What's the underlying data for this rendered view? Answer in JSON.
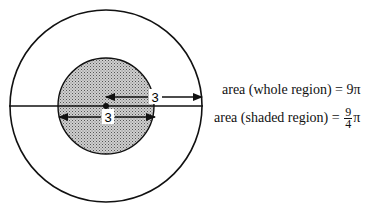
{
  "diagram": {
    "outer_circle": {
      "cx": 106,
      "cy": 106,
      "r": 96,
      "stroke": "#111111",
      "fill": "#ffffff"
    },
    "inner_circle": {
      "cx": 106,
      "cy": 106,
      "r": 48,
      "stroke": "#111111",
      "fill": "#b0b0b0",
      "shaded": true
    },
    "diameter_line": {
      "x1": 9,
      "x2": 203,
      "y": 106
    },
    "center_dot": {
      "cx": 106,
      "cy": 106,
      "r": 3
    },
    "upper_dimension": {
      "label": "3",
      "from_x": 106,
      "to_x": 202,
      "y": 97,
      "label_x": 155
    },
    "lower_dimension": {
      "label": "3",
      "from_x": 59,
      "to_x": 155,
      "y": 117,
      "label_x": 108
    }
  },
  "labels": {
    "whole": {
      "text": "area (whole region)",
      "eq": "=",
      "value": "9π"
    },
    "shaded": {
      "text": "area (shaded region)",
      "eq": "=",
      "numerator": "9",
      "denominator": "4",
      "suffix": "π"
    }
  }
}
